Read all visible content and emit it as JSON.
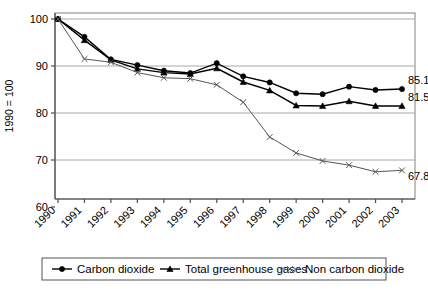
{
  "chart_data": {
    "type": "line",
    "title": "",
    "xlabel": "",
    "ylabel": "1990 = 100",
    "ylim": [
      60,
      100
    ],
    "yticks": [
      60,
      70,
      80,
      90,
      100
    ],
    "grid": true,
    "legend_position": "bottom",
    "categories": [
      "1990",
      "1991",
      "1992",
      "1993",
      "1994",
      "1995",
      "1996",
      "1997",
      "1998",
      "1999",
      "2000",
      "2001",
      "2002",
      "2003"
    ],
    "series": [
      {
        "name": "Carbon dioxide",
        "marker": "circle",
        "color": "#000000",
        "values": [
          100,
          96.2,
          91.4,
          90.2,
          89.0,
          88.5,
          90.6,
          87.8,
          86.5,
          84.2,
          84.0,
          85.6,
          84.9,
          85.1
        ],
        "end_label": "85.1"
      },
      {
        "name": "Total greenhouse gases",
        "marker": "triangle",
        "color": "#000000",
        "values": [
          100,
          95.5,
          91.3,
          89.4,
          88.6,
          88.3,
          89.5,
          86.6,
          84.8,
          81.6,
          81.5,
          82.5,
          81.5,
          81.5
        ],
        "end_label": "81.5"
      },
      {
        "name": "Non carbon dioxide",
        "marker": "cross",
        "color": "#555555",
        "values": [
          100,
          91.5,
          90.8,
          88.6,
          87.5,
          87.3,
          86.0,
          82.3,
          74.9,
          71.5,
          69.8,
          68.9,
          67.5,
          67.8
        ],
        "end_label": "67.8"
      }
    ],
    "annotations": [
      "85.1",
      "81.5",
      "67.8"
    ]
  },
  "legend": {
    "items": [
      {
        "label": "Carbon dioxide",
        "marker": "circle"
      },
      {
        "label": "Total greenhouse gases",
        "marker": "triangle"
      },
      {
        "label": "Non carbon dioxide",
        "marker": "cross"
      }
    ]
  },
  "axes": {
    "y_title": "1990 = 100",
    "y_ticks": [
      "100",
      "90",
      "80",
      "70",
      "60"
    ],
    "x_ticks": [
      "1990",
      "1991",
      "1992",
      "1993",
      "1994",
      "1995",
      "1996",
      "1997",
      "1998",
      "1999",
      "2000",
      "2001",
      "2002",
      "2003"
    ]
  }
}
